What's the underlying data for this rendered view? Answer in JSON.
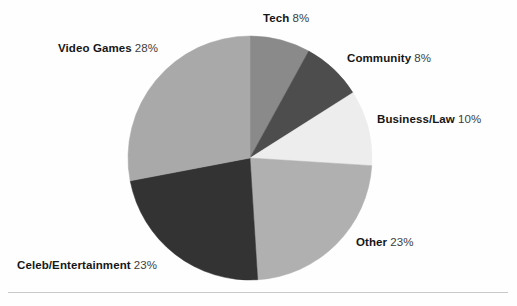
{
  "chart_data": {
    "type": "pie",
    "title": "",
    "subtitle": "",
    "xlabel": "",
    "ylabel": "",
    "legend_position": "none",
    "labels_outside": true,
    "start_angle_deg": 0,
    "direction": "clockwise",
    "categories": [
      "Tech",
      "Community",
      "Business/Law",
      "Other",
      "Celeb/Entertainment",
      "Video Games"
    ],
    "values": [
      8,
      8,
      10,
      23,
      23,
      28
    ],
    "value_unit": "%",
    "slices": [
      {
        "name": "Tech",
        "value": 8,
        "display_value": "8%",
        "color": "#8a8a8a",
        "start_deg": 0.0,
        "end_deg": 28.8
      },
      {
        "name": "Community",
        "value": 8,
        "display_value": "8%",
        "color": "#4d4d4d",
        "start_deg": 28.8,
        "end_deg": 57.6
      },
      {
        "name": "Business/Law",
        "value": 10,
        "display_value": "10%",
        "color": "#ededed",
        "start_deg": 57.6,
        "end_deg": 93.6
      },
      {
        "name": "Other",
        "value": 23,
        "display_value": "23%",
        "color": "#b0b0b0",
        "start_deg": 93.6,
        "end_deg": 176.4
      },
      {
        "name": "Celeb/Entertainment",
        "value": 23,
        "display_value": "23%",
        "color": "#333333",
        "start_deg": 176.4,
        "end_deg": 259.2
      },
      {
        "name": "Video Games",
        "value": 28,
        "display_value": "28%",
        "color": "#a9a9a9",
        "start_deg": 259.2,
        "end_deg": 360.0
      }
    ],
    "geometry": {
      "center_x": 250,
      "center_y": 158,
      "radius": 122
    },
    "colors": {
      "tech": "#8a8a8a",
      "community": "#4d4d4d",
      "business_law": "#ededed",
      "other": "#b0b0b0",
      "celeb_entertainment": "#333333",
      "video_games": "#a9a9a9",
      "background": "#fefefe",
      "label_text": "#161616",
      "percent_text": "#3d3d3d",
      "rule": "#c9c9c9"
    }
  },
  "labels": {
    "tech": {
      "name": "Tech",
      "percent": "8%"
    },
    "community": {
      "name": "Community",
      "percent": "8%"
    },
    "business": {
      "name": "Business/Law",
      "percent": "10%"
    },
    "other": {
      "name": "Other",
      "percent": "23%"
    },
    "celeb": {
      "name": "Celeb/Entertainment",
      "percent": "23%"
    },
    "video": {
      "name": "Video Games",
      "percent": "28%"
    }
  }
}
